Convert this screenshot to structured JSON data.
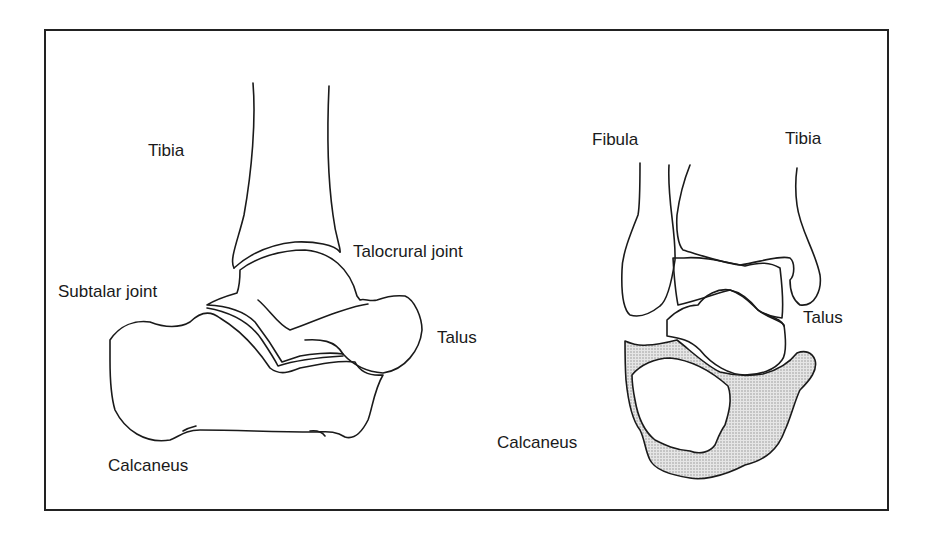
{
  "figure": {
    "colors": {
      "line": "#1a1a1a",
      "shade": "#d6d6d6",
      "frame": "#222222",
      "background": "#ffffff"
    }
  },
  "lateral_view": {
    "labels": {
      "tibia": "Tibia",
      "talocrural_joint": "Talocrural joint",
      "subtalar_joint": "Subtalar joint",
      "talus": "Talus",
      "calcaneus": "Calcaneus"
    }
  },
  "posterior_view": {
    "labels": {
      "fibula": "Fibula",
      "tibia": "Tibia",
      "talus": "Talus",
      "calcaneus": "Calcaneus"
    }
  }
}
